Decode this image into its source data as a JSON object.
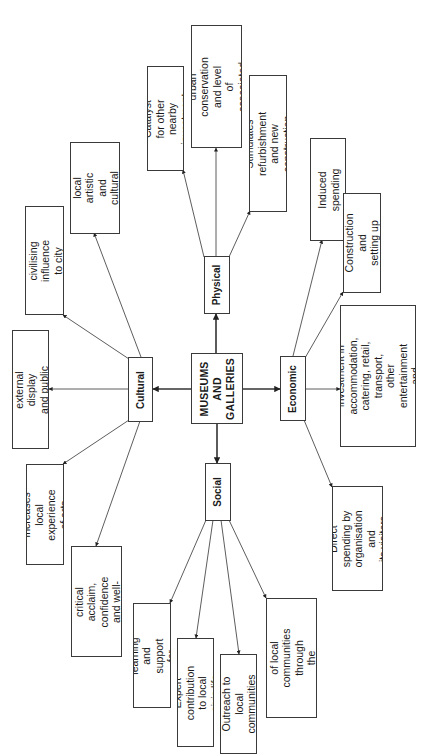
{
  "diagram": {
    "type": "radial-mind-map",
    "orientation": "rotated-90-ccw",
    "center": {
      "id": "center",
      "label": "MUSEUMS\nAND\nGALLERIES"
    },
    "hubs": [
      {
        "id": "physical",
        "label": "Physical"
      },
      {
        "id": "cultural",
        "label": "Cultural"
      },
      {
        "id": "economic",
        "label": "Economic"
      },
      {
        "id": "social",
        "label": "Social"
      }
    ],
    "leaves": {
      "physical": [
        {
          "id": "catalyst",
          "label": "Catalyst for other\nnearby investment"
        },
        {
          "id": "promotes",
          "label": "Promotes urban\nconservation and level\nof associated tourism"
        },
        {
          "id": "refurb",
          "label": "Stimulates refurbishment\nand new construction"
        }
      ],
      "cultural": [
        {
          "id": "stimlocal",
          "label": "Stimulates local\nartistic and\ncultural life"
        },
        {
          "id": "civilising",
          "label": "Adds civilising\ninfluence to city life"
        },
        {
          "id": "external",
          "label": "Generates external\ndisplay and public art"
        },
        {
          "id": "increases",
          "label": "Increases local\nexperience of arts"
        },
        {
          "id": "acclaim",
          "label": "Brings critical\nacclaim, confidence\nand well-being"
        }
      ],
      "economic": [
        {
          "id": "induced",
          "label": "Induced spending"
        },
        {
          "id": "construction",
          "label": "Construction and\nsetting up"
        },
        {
          "id": "stimulation",
          "label": "Stimulation of other\ninvestment in accommodation,\ncatering, retail, transport,\nother entertainment and\ncultural attractions"
        },
        {
          "id": "direct",
          "label": "Direct spending by\norganisation and\nits visitors"
        }
      ],
      "social": [
        {
          "id": "learning",
          "label": "Individual learning and\nsupport for education"
        },
        {
          "id": "expert",
          "label": "Expert contribution\nto local civic life"
        },
        {
          "id": "outreach",
          "label": "Outreach to local\ncommunities"
        },
        {
          "id": "reaffirm",
          "label": "Reaffirmation of local\ncommunities through\nthe collections"
        }
      ]
    },
    "colors": {
      "line": "#3a3a3a",
      "box_border": "#3a3a3a",
      "background": "#ffffff",
      "text": "#1a1a1a"
    }
  }
}
